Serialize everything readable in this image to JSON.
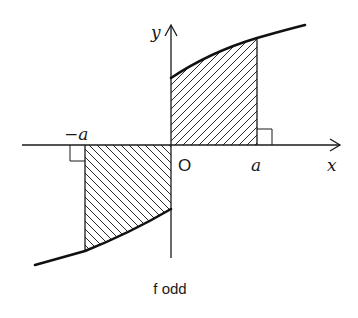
{
  "diagram": {
    "title": "f odd",
    "axes": {
      "x_label": "x",
      "y_label": "y",
      "origin_label": "O"
    },
    "ticks": {
      "positive": "a",
      "negative": "−a"
    },
    "regions": [
      {
        "name": "positive-area",
        "from": "0",
        "to": "a",
        "sign": "above x-axis",
        "hatch": "forward-slash"
      },
      {
        "name": "negative-area",
        "from": "-a",
        "to": "0",
        "sign": "below x-axis",
        "hatch": "back-slash"
      }
    ],
    "colors": {
      "ink": "#1a1a1a",
      "background": "#ffffff"
    }
  }
}
